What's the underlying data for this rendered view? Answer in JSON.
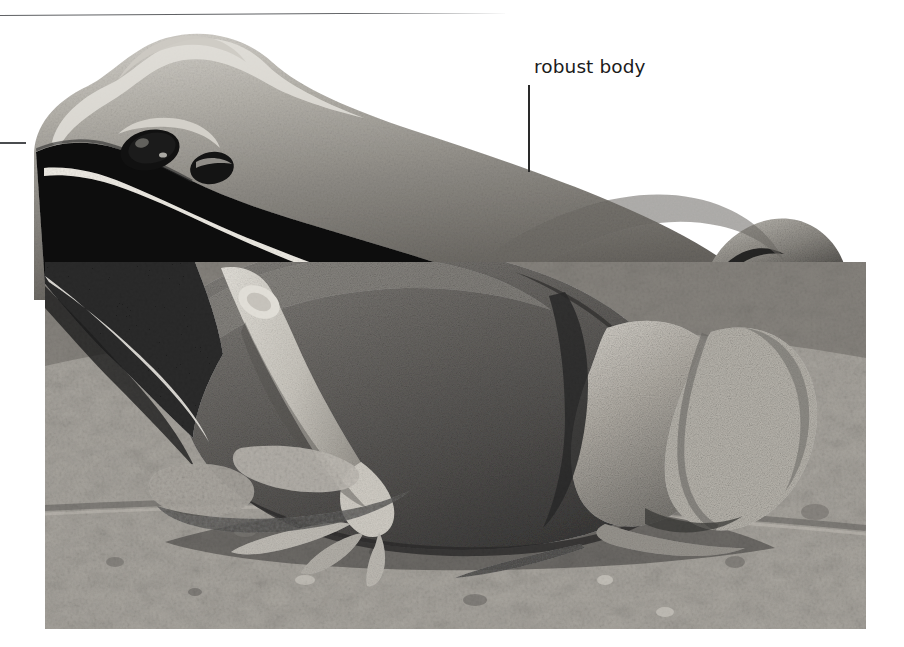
{
  "figure": {
    "kind": "labelled-photograph",
    "medium": "black-and-white photograph",
    "background_color": "#ffffff"
  },
  "rule": {
    "name": "top-divider",
    "color": "#5f6164",
    "x_start": 0,
    "x_end": 881,
    "y_left": 19,
    "y_right": 14
  },
  "left_mark": {
    "name": "cropped-leader-dash",
    "color": "#4a4c4f",
    "x": 0,
    "y": 142,
    "width": 26
  },
  "callout": {
    "text": "robust body",
    "text_color": "#1b1b1b",
    "font_size_px": 18.5,
    "text_x": 534,
    "text_y": 58,
    "leader": {
      "color": "#2a2a2a",
      "x": 528,
      "y_top": 85,
      "y_bottom": 172
    }
  },
  "photo": {
    "x": 45,
    "y": 262,
    "width": 821,
    "height": 367,
    "substrate": "rough rocky soil",
    "tones": {
      "paper": "#ffffff",
      "substrate_light": "#b9b5ad",
      "substrate_mid": "#8d8a85",
      "substrate_dark": "#4e4b47",
      "frog_dorsum": "#8f8d88",
      "frog_highlight": "#d8d6d0",
      "frog_flank_dark": "#101010",
      "frog_limb_pale": "#cfcbc2",
      "eye_stripe": "#0a0a0a",
      "lateral_line": "#e8e5de"
    }
  },
  "anatomy": [
    {
      "name": "snout",
      "note": "rounded, pale dorsum"
    },
    {
      "name": "eye",
      "note": "dark, set in black mask stripe"
    },
    {
      "name": "tympanum",
      "note": "behind eye within dark mask"
    },
    {
      "name": "supralabial-stripe",
      "note": "white line below eye mask"
    },
    {
      "name": "dorsum",
      "note": "granular warty skin"
    },
    {
      "name": "robust-body",
      "note": "stout rounded trunk — labelled"
    },
    {
      "name": "forelimb",
      "note": "pale, propped on substrate"
    },
    {
      "name": "hindlimb",
      "note": "folded thigh and shank, granular"
    },
    {
      "name": "toes",
      "note": "spread on rock"
    }
  ]
}
